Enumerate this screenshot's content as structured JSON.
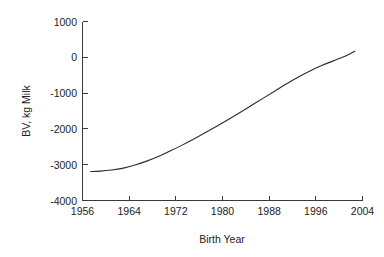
{
  "chart_data": {
    "type": "line",
    "title": "",
    "xlabel": "Birth Year",
    "ylabel": "BV, kg Milk",
    "xlim": [
      1956,
      2004
    ],
    "ylim": [
      -4000,
      1000
    ],
    "xticks": [
      1956,
      1964,
      1972,
      1980,
      1988,
      1996,
      2004
    ],
    "xtick_labels": [
      "1956",
      "1964",
      "1972",
      "1980",
      "1988",
      "1996",
      "2004"
    ],
    "yticks": [
      1000,
      0,
      -1000,
      -2000,
      -3000,
      -4000
    ],
    "ytick_labels": [
      "1000",
      "0",
      "-1000",
      "-2000",
      "-3000",
      "-4000"
    ],
    "grid": false,
    "legend": false,
    "legend_position": "none",
    "series": [
      {
        "name": "Breeding value trend",
        "color": "#2b2b2b",
        "x": [
          1957.4,
          1959,
          1961,
          1963,
          1965,
          1967,
          1969,
          1971,
          1973,
          1975,
          1977,
          1979,
          1981,
          1983,
          1985,
          1987,
          1989,
          1991,
          1993,
          1995,
          1997,
          1999,
          2001,
          2002.7
        ],
        "y": [
          -3190,
          -3180,
          -3150,
          -3095,
          -3010,
          -2900,
          -2770,
          -2620,
          -2460,
          -2290,
          -2110,
          -1925,
          -1735,
          -1540,
          -1340,
          -1140,
          -940,
          -740,
          -550,
          -380,
          -230,
          -100,
          30,
          170
        ]
      }
    ]
  },
  "axes": {
    "x_axis_name": "Birth Year",
    "y_axis_name": "BV, kg Milk"
  }
}
